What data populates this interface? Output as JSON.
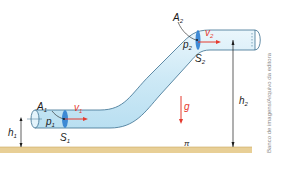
{
  "diagram": {
    "labels": {
      "A1": "A",
      "A1_sub": "1",
      "p1": "p",
      "p1_sub": "1",
      "v1": "v",
      "v1_sub": "1",
      "S1": "S",
      "S1_sub": "1",
      "h1": "h",
      "h1_sub": "1",
      "A2": "A",
      "A2_sub": "2",
      "p2": "p",
      "p2_sub": "2",
      "v2": "v",
      "v2_sub": "2",
      "S2": "S",
      "S2_sub": "2",
      "h2": "h",
      "h2_sub": "2",
      "g": "g",
      "plane": "π"
    },
    "credit": "Banco de imagens/Arquivo da editora",
    "colors": {
      "pipe_fill": "#d6eef8",
      "pipe_stroke": "#3a6f8f",
      "section": "#2f7fd0",
      "vector": "#e53a2e",
      "ground": "#e8cf96"
    }
  }
}
